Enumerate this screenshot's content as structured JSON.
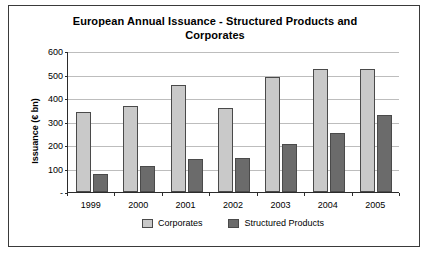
{
  "chart_data": {
    "type": "bar",
    "title": "European Annual Issuance - Structured Products and Corporates",
    "xlabel": "",
    "ylabel": "Issuance (€ bn)",
    "categories": [
      "1999",
      "2000",
      "2001",
      "2002",
      "2003",
      "2004",
      "2005"
    ],
    "series": [
      {
        "name": "Corporates",
        "values": [
          340,
          368,
          455,
          358,
          490,
          525,
          522
        ],
        "color": "#c9c9c9"
      },
      {
        "name": "Structured Products",
        "values": [
          78,
          110,
          142,
          145,
          203,
          252,
          327
        ],
        "color": "#6b6b6b"
      }
    ],
    "ylim": [
      0,
      600
    ],
    "yticks": [
      "-",
      "100",
      "200",
      "300",
      "400",
      "500",
      "600"
    ],
    "ytick_values": [
      0,
      100,
      200,
      300,
      400,
      500,
      600
    ],
    "grid": true,
    "legend_position": "bottom"
  }
}
